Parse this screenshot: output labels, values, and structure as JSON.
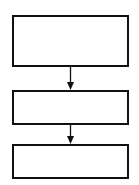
{
  "diagram": {
    "type": "flowchart",
    "stroke_color": "#111111",
    "background": "#ffffff",
    "nodes": [
      {
        "id": "box-1",
        "label": "",
        "x": 13,
        "y": 16,
        "w": 115,
        "h": 50
      },
      {
        "id": "box-2",
        "label": "",
        "x": 13,
        "y": 91,
        "w": 115,
        "h": 33
      },
      {
        "id": "box-3",
        "label": "",
        "x": 13,
        "y": 145,
        "w": 115,
        "h": 33
      }
    ],
    "edges": [
      {
        "from": "box-1",
        "to": "box-2"
      },
      {
        "from": "box-2",
        "to": "box-3"
      }
    ]
  }
}
